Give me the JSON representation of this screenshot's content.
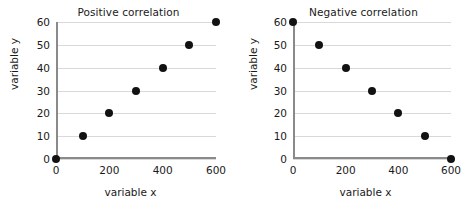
{
  "chart_data": [
    {
      "type": "scatter",
      "title": "Positive correlation",
      "xlabel": "variable x",
      "ylabel": "variable y",
      "xlim": [
        0,
        600
      ],
      "ylim": [
        0,
        60
      ],
      "xticks": [
        0,
        200,
        400,
        600
      ],
      "yticks": [
        0,
        10,
        20,
        30,
        40,
        50,
        60
      ],
      "grid": "horizontal",
      "legend": "none",
      "marker_color": "#121212",
      "grid_color": "#d9d9d9",
      "axis_color": "#8a8a8a",
      "x": [
        0,
        100,
        200,
        300,
        400,
        500,
        600
      ],
      "y": [
        0,
        10,
        20,
        30,
        40,
        50,
        60
      ]
    },
    {
      "type": "scatter",
      "title": "Negative correlation",
      "xlabel": "variable x",
      "ylabel": "variable y",
      "xlim": [
        0,
        600
      ],
      "ylim": [
        0,
        60
      ],
      "xticks": [
        0,
        200,
        400,
        600
      ],
      "yticks": [
        0,
        10,
        20,
        30,
        40,
        50,
        60
      ],
      "grid": "horizontal",
      "legend": "none",
      "marker_color": "#121212",
      "grid_color": "#d9d9d9",
      "axis_color": "#8a8a8a",
      "x": [
        0,
        100,
        200,
        300,
        400,
        500,
        600
      ],
      "y": [
        60,
        50,
        40,
        30,
        20,
        10,
        0
      ]
    }
  ]
}
